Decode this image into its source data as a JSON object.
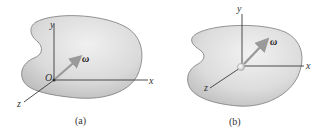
{
  "figure": {
    "panels": [
      {
        "id": "a",
        "caption": "(a)",
        "origin_label": "O",
        "axes": {
          "x": "x",
          "y": "y",
          "z": "z"
        },
        "vector_label": "ω"
      },
      {
        "id": "b",
        "caption": "(b)",
        "axes": {
          "x": "x",
          "y": "y",
          "z": "z"
        },
        "vector_label": "ω"
      }
    ],
    "colors": {
      "body_fill_light": "#ececec",
      "body_fill_dark": "#c4c4c4",
      "body_stroke": "#7a7a7a",
      "axis": "#3a3a3a",
      "omega_arrow": "#9a9a9a"
    }
  }
}
